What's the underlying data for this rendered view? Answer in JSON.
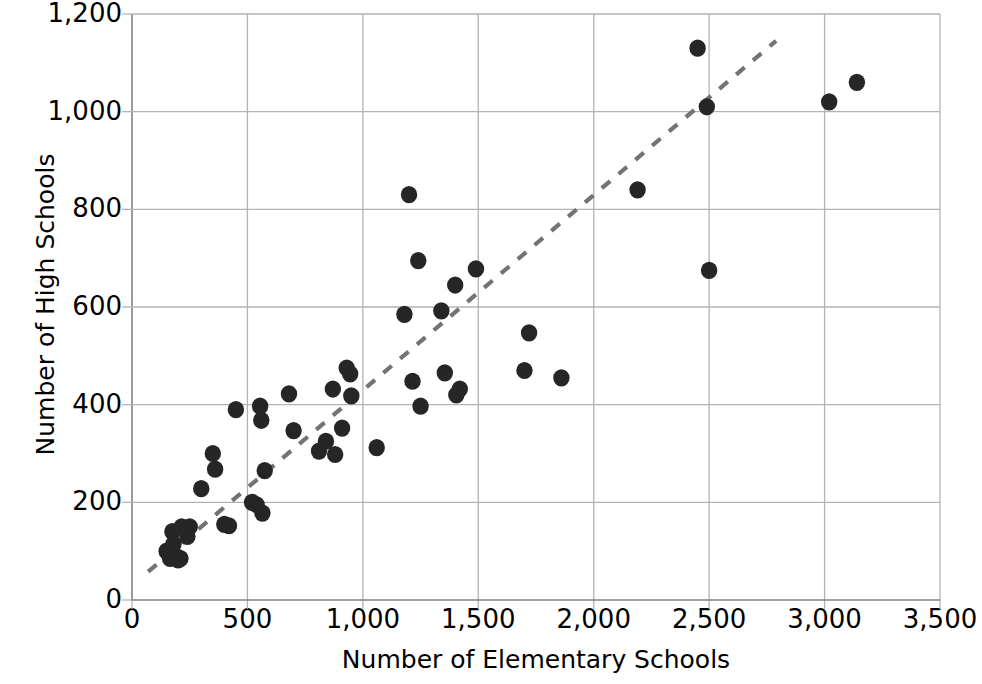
{
  "chart_data": {
    "type": "scatter",
    "title": "",
    "xlabel": "Number of Elementary Schools",
    "ylabel": "Number of High Schools",
    "xlim": [
      0,
      3500
    ],
    "ylim": [
      0,
      1200
    ],
    "grid": true,
    "legend": "none",
    "xticks": [
      "0",
      "500",
      "1,000",
      "1,500",
      "2,000",
      "2,500",
      "3,000",
      "3,500"
    ],
    "xtick_values": [
      0,
      500,
      1000,
      1500,
      2000,
      2500,
      3000,
      3500
    ],
    "yticks": [
      "0",
      "200",
      "400",
      "600",
      "800",
      "1,000",
      "1,200"
    ],
    "ytick_values": [
      0,
      200,
      400,
      600,
      800,
      1000,
      1200
    ],
    "marker": {
      "shape": "circle",
      "color": "#262626",
      "size": 15
    },
    "trendline": {
      "style": "dashed",
      "color": "#737373",
      "x_start": 70,
      "y_start": 58,
      "x_end": 2790,
      "y_end": 1145
    },
    "points": [
      {
        "x": 150,
        "y": 100
      },
      {
        "x": 165,
        "y": 85
      },
      {
        "x": 175,
        "y": 140
      },
      {
        "x": 180,
        "y": 115
      },
      {
        "x": 190,
        "y": 90
      },
      {
        "x": 200,
        "y": 82
      },
      {
        "x": 210,
        "y": 85
      },
      {
        "x": 215,
        "y": 150
      },
      {
        "x": 240,
        "y": 130
      },
      {
        "x": 250,
        "y": 150
      },
      {
        "x": 300,
        "y": 228
      },
      {
        "x": 350,
        "y": 300
      },
      {
        "x": 360,
        "y": 268
      },
      {
        "x": 400,
        "y": 155
      },
      {
        "x": 420,
        "y": 152
      },
      {
        "x": 450,
        "y": 390
      },
      {
        "x": 520,
        "y": 200
      },
      {
        "x": 540,
        "y": 195
      },
      {
        "x": 555,
        "y": 397
      },
      {
        "x": 560,
        "y": 368
      },
      {
        "x": 565,
        "y": 178
      },
      {
        "x": 575,
        "y": 265
      },
      {
        "x": 680,
        "y": 422
      },
      {
        "x": 700,
        "y": 347
      },
      {
        "x": 810,
        "y": 305
      },
      {
        "x": 840,
        "y": 325
      },
      {
        "x": 870,
        "y": 432
      },
      {
        "x": 880,
        "y": 298
      },
      {
        "x": 910,
        "y": 352
      },
      {
        "x": 930,
        "y": 475
      },
      {
        "x": 945,
        "y": 463
      },
      {
        "x": 950,
        "y": 418
      },
      {
        "x": 1060,
        "y": 312
      },
      {
        "x": 1180,
        "y": 585
      },
      {
        "x": 1200,
        "y": 830
      },
      {
        "x": 1215,
        "y": 448
      },
      {
        "x": 1240,
        "y": 695
      },
      {
        "x": 1250,
        "y": 397
      },
      {
        "x": 1340,
        "y": 592
      },
      {
        "x": 1355,
        "y": 465
      },
      {
        "x": 1400,
        "y": 645
      },
      {
        "x": 1405,
        "y": 420
      },
      {
        "x": 1420,
        "y": 432
      },
      {
        "x": 1490,
        "y": 678
      },
      {
        "x": 1700,
        "y": 470
      },
      {
        "x": 1720,
        "y": 547
      },
      {
        "x": 1860,
        "y": 455
      },
      {
        "x": 2190,
        "y": 840
      },
      {
        "x": 2450,
        "y": 1130
      },
      {
        "x": 2490,
        "y": 1010
      },
      {
        "x": 2500,
        "y": 675
      },
      {
        "x": 3020,
        "y": 1020
      },
      {
        "x": 3140,
        "y": 1060
      }
    ]
  },
  "axes": {
    "x_title": "Number of Elementary Schools",
    "y_title": "Number of High Schools"
  },
  "colors": {
    "marker": "#262626",
    "trendline": "#737373",
    "grid": "#b3b3b3",
    "axis": "#808080",
    "text": "#000000",
    "background": "#ffffff"
  }
}
